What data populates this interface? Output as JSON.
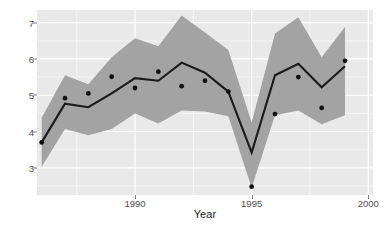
{
  "chart_data": {
    "type": "line",
    "title": "",
    "subtitle": "",
    "xlabel": "Year",
    "ylabel": "log Population Size",
    "xlim": [
      1985.8,
      2000.2
    ],
    "ylim": [
      2.25,
      7.35
    ],
    "grid": true,
    "legend": null,
    "x": [
      1986,
      1987,
      1988,
      1989,
      1990,
      1991,
      1992,
      1993,
      1994,
      1995,
      1996,
      1997,
      1998,
      1999,
      2000
    ],
    "x_ticks": [
      1990,
      1995,
      2000
    ],
    "x_tick_labels": [
      "1990",
      "1995",
      "2000"
    ],
    "y_ticks": [
      3,
      4,
      5,
      6,
      7
    ],
    "y_tick_labels": [
      "3",
      "4",
      "5",
      "6",
      "7"
    ],
    "series": [
      {
        "name": "fitted trend",
        "kind": "line",
        "color": "#1a1a1a",
        "values": [
          3.7,
          4.77,
          4.67,
          5.05,
          5.47,
          5.4,
          5.9,
          5.62,
          5.1,
          3.42,
          5.55,
          5.87,
          5.22,
          5.8,
          null
        ]
      },
      {
        "name": "observed",
        "kind": "scatter",
        "color": "#101010",
        "values": [
          3.7,
          4.92,
          5.05,
          5.51,
          5.2,
          5.65,
          5.25,
          5.4,
          5.1,
          2.48,
          4.48,
          5.5,
          4.65,
          5.95,
          null
        ]
      },
      {
        "name": "confidence band lower",
        "kind": "ribbon-lower",
        "color": "#a3a3a3",
        "values": [
          3.03,
          4.07,
          3.9,
          4.07,
          4.5,
          4.22,
          4.58,
          4.55,
          4.42,
          2.45,
          4.45,
          4.58,
          4.2,
          4.45,
          null
        ]
      },
      {
        "name": "confidence band upper",
        "kind": "ribbon-upper",
        "color": "#a3a3a3",
        "values": [
          4.38,
          5.55,
          5.3,
          6.05,
          6.57,
          6.35,
          7.2,
          6.73,
          6.25,
          4.25,
          6.7,
          7.15,
          6.05,
          6.88,
          null
        ]
      }
    ],
    "colors": {
      "panel_background": "#e9e9e9",
      "grid_major": "#ffffff",
      "grid_minor": "#f4f4f4",
      "ribbon": "#a3a3a3",
      "line": "#1a1a1a",
      "point": "#101010",
      "tick_text": "#4d4d4d",
      "axis_title": "#1a1a1a",
      "figure_background": "#ffffff"
    }
  }
}
